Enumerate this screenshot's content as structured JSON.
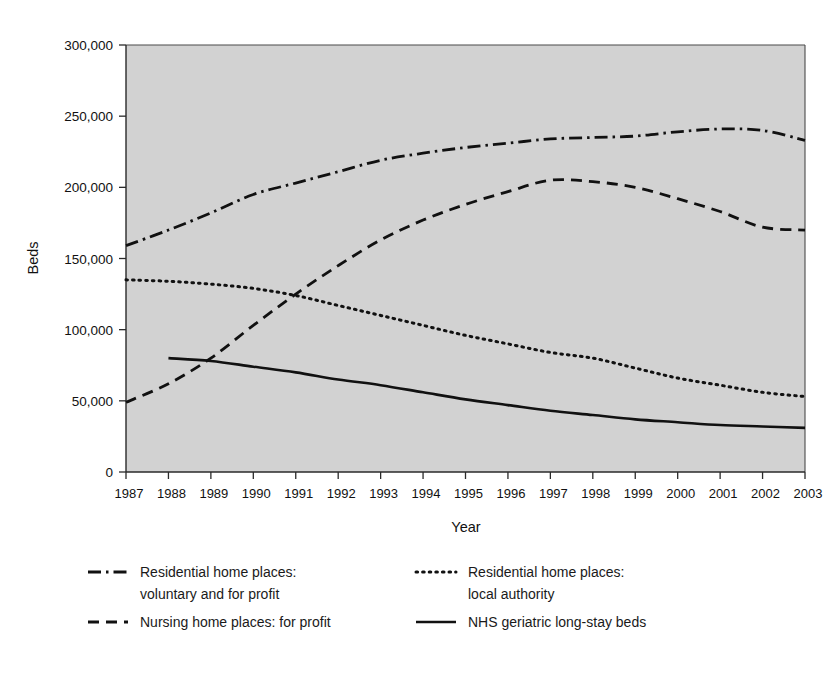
{
  "chart_data": {
    "type": "line",
    "title": "",
    "xlabel": "Year",
    "ylabel": "Beds",
    "xlim": [
      1987,
      2003
    ],
    "ylim": [
      0,
      300000
    ],
    "yticks": [
      0,
      50000,
      100000,
      150000,
      200000,
      250000,
      300000
    ],
    "ytick_labels": [
      "0",
      "50,000",
      "100,000",
      "150,000",
      "200,000",
      "250,000",
      "300,000"
    ],
    "x": [
      1987,
      1988,
      1989,
      1990,
      1991,
      1992,
      1993,
      1994,
      1995,
      1996,
      1997,
      1998,
      1999,
      2000,
      2001,
      2002,
      2003
    ],
    "xtick_labels": [
      "1987",
      "1988",
      "1989",
      "1990",
      "1991",
      "1992",
      "1993",
      "1994",
      "1995",
      "1996",
      "1997",
      "1998",
      "1999",
      "2000",
      "2001",
      "2002",
      "2003"
    ],
    "grid": false,
    "plot_background": "#d2d2d2",
    "legend_position": "below-plot",
    "series": [
      {
        "name": "Residential home places: voluntary and for profit",
        "key": "residential-voluntary-for-profit",
        "style": "dash-dot",
        "color": "#111111",
        "values": [
          159000,
          170000,
          182000,
          195000,
          203000,
          211000,
          219000,
          224000,
          228000,
          231000,
          234000,
          235000,
          236000,
          239000,
          241000,
          240000,
          233000
        ]
      },
      {
        "name": "Residential home places: local authority",
        "key": "residential-local-authority",
        "style": "dotted",
        "color": "#111111",
        "values": [
          135000,
          134000,
          132000,
          129000,
          124000,
          117000,
          110000,
          103000,
          96000,
          90000,
          84000,
          80000,
          73000,
          66000,
          61000,
          56000,
          53000
        ]
      },
      {
        "name": "Nursing home places: for profit",
        "key": "nursing-home-for-profit",
        "style": "dashed",
        "color": "#111111",
        "values": [
          49000,
          62000,
          80000,
          103000,
          125000,
          145000,
          163000,
          177000,
          188000,
          197000,
          205000,
          204000,
          200000,
          192000,
          183000,
          172000,
          170000
        ]
      },
      {
        "name": "NHS geriatric long-stay beds",
        "key": "nhs-geriatric-long-stay",
        "style": "solid",
        "color": "#111111",
        "values": [
          null,
          80000,
          78000,
          74000,
          70000,
          65000,
          61000,
          56000,
          51000,
          47000,
          43000,
          40000,
          37000,
          35000,
          33000,
          32000,
          31000
        ]
      }
    ]
  },
  "legend": {
    "items": [
      {
        "style": "dash-dot",
        "line1": "Residential home places:",
        "line2": "voluntary and for profit"
      },
      {
        "style": "dotted",
        "line1": "Residential home places:",
        "line2": "local authority"
      },
      {
        "style": "dashed",
        "line1": "Nursing home places: for profit",
        "line2": ""
      },
      {
        "style": "solid",
        "line1": "NHS geriatric long-stay beds",
        "line2": ""
      }
    ]
  }
}
